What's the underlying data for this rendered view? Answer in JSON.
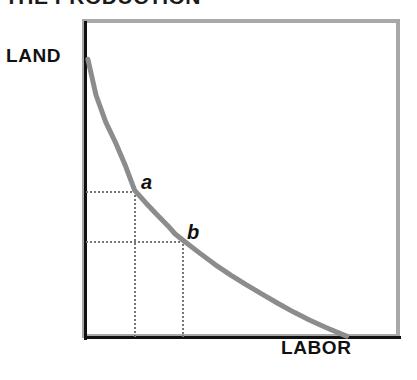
{
  "chart_data": {
    "type": "line",
    "title": "THE PRODUCTION",
    "xlabel": "LABOR",
    "ylabel": "LAND",
    "grid": false,
    "legend": null,
    "xlim": [
      0,
      100
    ],
    "ylim": [
      0,
      100
    ],
    "curve_name": "isoquant",
    "curve_color": "#8c8c8c",
    "annotations": [
      {
        "label": "a",
        "x": 15.5,
        "y": 46.4,
        "guides": "dotted lines drawn to both axes"
      },
      {
        "label": "b",
        "x": 30.9,
        "y": 30.6,
        "guides": "dotted lines drawn to both axes"
      }
    ],
    "series": [
      {
        "name": "isoquant",
        "x": [
          0.6,
          3.2,
          6.3,
          9.5,
          12.6,
          15.5,
          19.0,
          22.4,
          25.9,
          28.4,
          30.9,
          36.0,
          41.0,
          46.1,
          51.1,
          56.2,
          61.2,
          66.3,
          71.3,
          76.4,
          81.4,
          83.0
        ],
        "y": [
          87.9,
          76.5,
          68.0,
          61.3,
          54.1,
          46.4,
          42.5,
          38.9,
          35.4,
          32.6,
          30.6,
          26.7,
          23.0,
          19.6,
          16.5,
          13.5,
          10.6,
          7.8,
          5.3,
          3.0,
          0.9,
          0.3
        ]
      }
    ]
  },
  "axes": {
    "y_title": "LAND",
    "x_title": "LABOR"
  },
  "points": {
    "a": "a",
    "b": "b"
  },
  "title": {
    "text": "THE PRODUCTION"
  }
}
